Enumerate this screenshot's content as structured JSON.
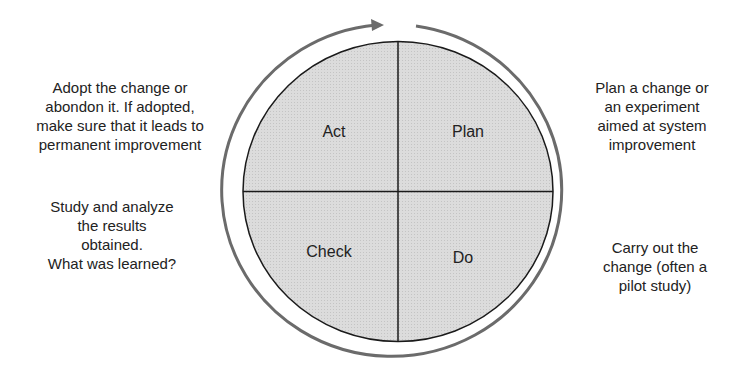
{
  "diagram": {
    "type": "PDCA cycle",
    "colors": {
      "quadrant_fill": "#d9d9d9",
      "circle_stroke": "#1a1a1a",
      "cycle_arrow": "#6b6b6b",
      "text": "#222222"
    },
    "quadrants": {
      "act": {
        "label": "Act"
      },
      "plan": {
        "label": "Plan"
      },
      "check": {
        "label": "Check"
      },
      "do": {
        "label": "Do"
      }
    },
    "descriptions": {
      "act": "Adopt the change or\nabondon it. If adopted,\nmake sure that it leads to\npermanent improvement",
      "plan": "Plan a change or\nan experiment\naimed at system\nimprovement",
      "check": "Study and analyze\nthe results\nobtained.\nWhat was learned?",
      "do": "Carry out the\nchange (often a\npilot study)"
    },
    "cycle_direction": "clockwise"
  }
}
